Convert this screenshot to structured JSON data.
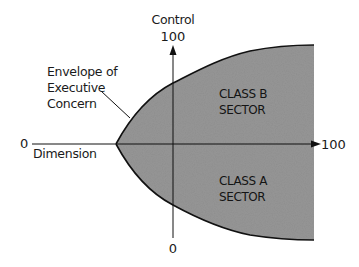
{
  "diagram": {
    "vertical_axis": {
      "title": "Control",
      "max_label": "100",
      "min_label": "0"
    },
    "horizontal_axis": {
      "title": "Dimension",
      "min_label": "0",
      "max_label": "100"
    },
    "envelope_label": {
      "line1": "Envelope of",
      "line2": "Executive",
      "line3": "Concern"
    },
    "regions": [
      {
        "line1": "CLASS B",
        "line2": "SECTOR"
      },
      {
        "line1": "CLASS A",
        "line2": "SECTOR"
      }
    ],
    "colors": {
      "fill": "#8c8c8c",
      "stroke": "#111111",
      "background": "#ffffff"
    }
  }
}
